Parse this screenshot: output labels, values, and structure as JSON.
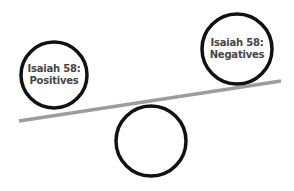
{
  "diagram": {
    "type": "seesaw-balance",
    "colors": {
      "background": "#ffffff",
      "circle_stroke": "#111111",
      "beam": "#9c9c9c",
      "text": "#454545"
    },
    "beam": {
      "x1": 19,
      "y1": 121,
      "x2": 281,
      "y2": 81,
      "width": 3.5
    },
    "circles": [
      {
        "id": "positives",
        "cx": 54,
        "cy": 75,
        "r": 35,
        "label_line1": "Isaiah 58:",
        "label_line2": "Positives"
      },
      {
        "id": "negatives",
        "cx": 237,
        "cy": 49,
        "r": 37,
        "label_line1": "Isaiah 58:",
        "label_line2": "Negatives"
      },
      {
        "id": "fulcrum",
        "cx": 151,
        "cy": 141,
        "r": 37,
        "label_line1": "",
        "label_line2": ""
      }
    ]
  }
}
